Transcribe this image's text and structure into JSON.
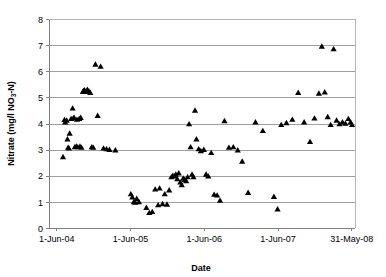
{
  "chart_data": {
    "type": "scatter",
    "title": "",
    "xlabel": "Date",
    "ylabel": "Nitrate (mg/l NO3-N)",
    "ylabel_parts": {
      "prefix": "Nitrate (mg/l NO",
      "subscript": "3",
      "suffix": "-N)"
    },
    "ylim": [
      0,
      8
    ],
    "y_ticks": [
      "0",
      "1",
      "2",
      "3",
      "4",
      "5",
      "6",
      "7",
      "8"
    ],
    "y_tick_values": [
      0,
      1,
      2,
      3,
      4,
      5,
      6,
      7,
      8
    ],
    "x_ticks": [
      "1-Jun-04",
      "1-Jun-05",
      "1-Jun-06",
      "1-Jun-07",
      "31-May-08"
    ],
    "x_tick_values": [
      0,
      1,
      2,
      3,
      4
    ],
    "xlim": [
      -0.1,
      4.05
    ],
    "grid": "horizontal",
    "legend": "none",
    "marker": "triangle",
    "marker_color": "#000000",
    "series": [
      {
        "name": "Nitrate",
        "x": [
          0.09,
          0.11,
          0.12,
          0.14,
          0.15,
          0.16,
          0.17,
          0.18,
          0.2,
          0.22,
          0.23,
          0.24,
          0.25,
          0.27,
          0.28,
          0.29,
          0.31,
          0.32,
          0.33,
          0.34,
          0.36,
          0.37,
          0.38,
          0.4,
          0.42,
          0.44,
          0.46,
          0.48,
          0.5,
          0.53,
          0.56,
          0.6,
          0.64,
          0.68,
          0.72,
          0.8,
          1.01,
          1.03,
          1.05,
          1.07,
          1.09,
          1.12,
          1.22,
          1.26,
          1.3,
          1.34,
          1.38,
          1.4,
          1.44,
          1.47,
          1.5,
          1.53,
          1.56,
          1.58,
          1.6,
          1.62,
          1.64,
          1.66,
          1.68,
          1.7,
          1.72,
          1.74,
          1.76,
          1.78,
          1.8,
          1.82,
          1.84,
          1.86,
          1.88,
          1.9,
          1.93,
          1.96,
          2.0,
          2.03,
          2.06,
          2.1,
          2.14,
          2.18,
          2.22,
          2.28,
          2.34,
          2.4,
          2.46,
          2.52,
          2.6,
          2.7,
          2.8,
          2.95,
          3.0,
          3.05,
          3.12,
          3.2,
          3.28,
          3.36,
          3.44,
          3.5,
          3.56,
          3.6,
          3.64,
          3.68,
          3.72,
          3.76,
          3.8,
          3.84,
          3.88,
          3.92,
          3.96,
          3.99,
          4.01
        ],
        "y": [
          2.72,
          4.14,
          4.05,
          4.12,
          3.4,
          3.08,
          3.05,
          3.62,
          4.18,
          4.58,
          4.2,
          4.22,
          3.1,
          3.12,
          4.15,
          3.1,
          4.18,
          3.12,
          4.22,
          3.08,
          5.22,
          5.25,
          5.28,
          5.22,
          5.3,
          5.24,
          5.18,
          3.1,
          3.08,
          6.26,
          4.3,
          6.18,
          3.05,
          3.02,
          3.0,
          2.98,
          1.3,
          1.18,
          1.0,
          0.98,
          1.12,
          1.0,
          0.78,
          0.58,
          0.62,
          1.48,
          0.88,
          1.52,
          0.92,
          1.3,
          0.9,
          1.45,
          1.95,
          2.0,
          1.98,
          2.05,
          1.88,
          2.1,
          1.75,
          1.65,
          1.9,
          1.85,
          1.8,
          1.95,
          3.98,
          3.1,
          2.05,
          1.95,
          4.5,
          3.4,
          3.02,
          2.95,
          3.0,
          2.05,
          1.98,
          2.88,
          1.28,
          1.25,
          1.05,
          4.1,
          3.08,
          3.1,
          2.98,
          2.55,
          1.35,
          4.05,
          3.72,
          1.2,
          0.72,
          3.95,
          4.02,
          4.15,
          5.18,
          4.05,
          3.3,
          4.2,
          5.15,
          6.95,
          5.2,
          4.25,
          3.95,
          6.85,
          4.12,
          3.98,
          4.05,
          4.0,
          4.18,
          4.05,
          3.95
        ]
      }
    ]
  },
  "axis_titles": {
    "x": "Date",
    "y_prefix": "Nitrate (mg/l NO",
    "y_sub": "3",
    "y_suffix": "-N)"
  }
}
